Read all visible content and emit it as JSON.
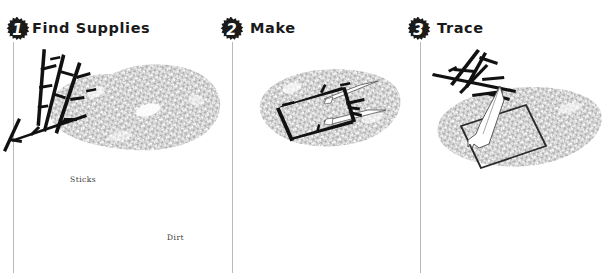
{
  "sheet": {
    "title": "Stick Frame Tracing Tutorial",
    "background_color": "#ffffff",
    "rule_color": "#b9b9b9",
    "badge_color": "#1a1a1a",
    "text_color": "#1a1a1a",
    "ink_color": "#111111",
    "dirt_color": "#9a9a9a",
    "highlight_color": "#ffffff"
  },
  "steps": [
    {
      "number": "1",
      "title": "Find Supplies",
      "badge_icon": "starburst-badge-icon",
      "art_icon": "stick-pile-and-dirt-patch-icon",
      "captions": [
        {
          "id": "sticks",
          "text": "Sticks"
        },
        {
          "id": "dirt",
          "text": "Dirt"
        }
      ]
    },
    {
      "number": "2",
      "title": "Make",
      "badge_icon": "starburst-badge-icon",
      "art_icon": "stick-square-frame-on-dirt-icon",
      "captions": []
    },
    {
      "number": "3",
      "title": "Trace",
      "badge_icon": "starburst-badge-icon",
      "art_icon": "hand-tracing-square-in-dirt-icon",
      "captions": []
    }
  ]
}
